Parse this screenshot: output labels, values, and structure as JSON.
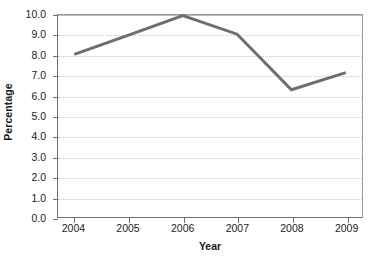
{
  "chart_data": {
    "type": "line",
    "title": "",
    "subtitle": "",
    "xlabel": "Year",
    "ylabel": "Percentage",
    "categories": [
      "2004",
      "2005",
      "2006",
      "2007",
      "2008",
      "2009"
    ],
    "x": [
      2004,
      2005,
      2006,
      2007,
      2008,
      2009
    ],
    "values": [
      8.05,
      9.0,
      9.97,
      9.05,
      6.3,
      7.15
    ],
    "series": [
      {
        "name": "Percentage",
        "values": [
          8.05,
          9.0,
          9.97,
          9.05,
          6.3,
          7.15
        ],
        "color": "#6e6e6e",
        "line_width": 3,
        "markers": false
      }
    ],
    "xlim": [
      2003.7,
      2009.3
    ],
    "ylim": [
      0.0,
      10.0
    ],
    "ytick_values": [
      0.0,
      1.0,
      2.0,
      3.0,
      4.0,
      5.0,
      6.0,
      7.0,
      8.0,
      9.0,
      10.0
    ],
    "ytick_labels": [
      "0.0",
      "1.0",
      "2.0",
      "3.0",
      "4.0",
      "5.0",
      "6.0",
      "7.0",
      "8.0",
      "9.0",
      "10.0"
    ],
    "xtick_labels": [
      "2004",
      "2005",
      "2006",
      "2007",
      "2008",
      "2009"
    ],
    "grid": {
      "horizontal": true,
      "vertical": false,
      "style": "dotted",
      "color": "#c9c9c9"
    },
    "legend": {
      "visible": false,
      "position": "none",
      "entries": []
    },
    "annotations": [],
    "colors": {
      "line": "#6e6e6e",
      "axis": "#6f6f6f",
      "grid": "#c9c9c9",
      "text": "#1a1a1a",
      "background": "#ffffff"
    }
  }
}
